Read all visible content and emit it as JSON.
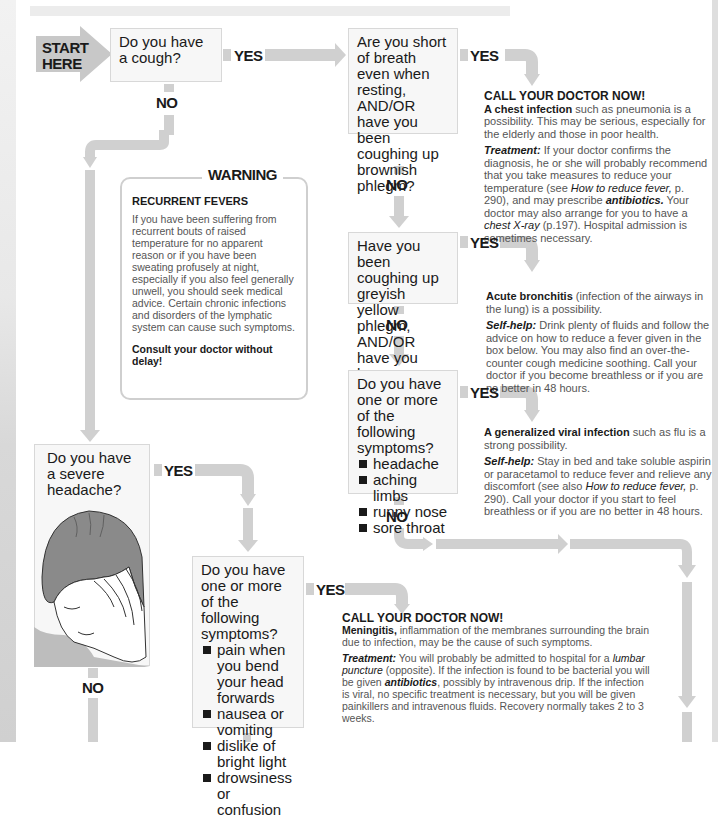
{
  "start": {
    "label_line1": "START",
    "label_line2": "HERE"
  },
  "labels": {
    "yes": "YES",
    "no": "NO"
  },
  "questions": {
    "q1": "Do you have a cough?",
    "q2": "Are you short of breath even when resting, AND/OR have you been coughing up brownish phlegm?",
    "q3": "Have you been coughing up greyish yellow phlegm, AND/OR have you been wheezing?",
    "q4": {
      "text": "Do you have one or more of the following symptoms?",
      "items": [
        "headache",
        "aching limbs",
        "runny nose",
        "sore throat"
      ]
    },
    "q5": "Do you have a severe headache?",
    "q6": {
      "text": "Do you have one or more of the following symptoms?",
      "items": [
        "pain when you bend your head forwards",
        "nausea or vomiting",
        "dislike of bright light",
        "drowsiness or confusion"
      ]
    }
  },
  "answers": {
    "a1": {
      "header": "CALL YOUR DOCTOR NOW!",
      "bold": "A chest infection",
      "text": " such as pneumonia is a possibility. This may be serious, especially for the elderly and those in poor health.",
      "label": "Treatment:",
      "t1": " If your doctor confirms the diagnosis, he or she will probably recommend that you take measures to reduce your temperature (see ",
      "i1": "How to reduce fever,",
      "t2": " p. 290), and may prescribe ",
      "b2": "antibiotics.",
      "t3": " Your doctor may also arrange for you to have a ",
      "i2": "chest X-ray",
      "t4": " (p.197). Hospital admission is sometimes necessary."
    },
    "a2": {
      "bold": "Acute bronchitis",
      "text": " (infection of the airways in the lung) is a possibility.",
      "label": "Self-help:",
      "t1": " Drink plenty of fluids and follow the advice on how to reduce a fever given in the box below. You may also find an over-the-counter cough medicine soothing. Call your doctor if you become breathless or if you are no better in 48 hours."
    },
    "a3": {
      "bold": "A generalized viral infection",
      "text": " such as flu is a strong possibility.",
      "label": "Self-help:",
      "t1": " Stay in bed and take soluble aspirin or paracetamol to reduce fever and relieve any discomfort (see also ",
      "i1": "How to reduce fever,",
      "t2": " p. 290). Call your doctor if you start to feel breathless or if you are no better in 48 hours."
    },
    "a4": {
      "header": "CALL YOUR DOCTOR NOW!",
      "bold": "Meningitis,",
      "text": " inflammation of the membranes surrounding the brain due to infection, may be the cause of such symptoms.",
      "label": "Treatment:",
      "t1": " You will probably be admitted to hospital for a ",
      "i1": "lumbar puncture",
      "t2": " (opposite). If the infection is found to be bacterial you will be given ",
      "b2": "antibiotics",
      "t3": ", possibly by intravenous drip. If the infection is viral, no specific treatment is necessary, but you will be given painkillers and intravenous fluids. Recovery normally takes 2 to 3 weeks."
    }
  },
  "warning": {
    "title": "WARNING",
    "heading": "RECURRENT FEVERS",
    "body": "If you have been suffering from recurrent bouts of raised temperature for no apparent reason or if you have been sweating profusely at night, especially if you also feel generally unwell, you should seek medical advice. Certain chronic infections and disorders of the lymphatic system can cause such symptoms.",
    "consult": "Consult your doctor without delay!"
  },
  "colors": {
    "arrow": "#d0d0d0",
    "box_bg": "#f7f7f7",
    "start_arrow": "#c8c8c8",
    "text": "#1a1a1a"
  }
}
